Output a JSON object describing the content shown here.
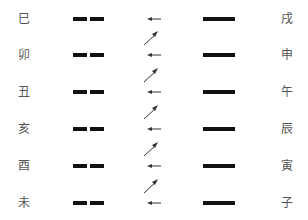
{
  "diagram": {
    "rows": [
      {
        "left_label": "巳",
        "right_label": "戌",
        "left_line": "broken",
        "right_line": "solid"
      },
      {
        "left_label": "卯",
        "right_label": "申",
        "left_line": "broken",
        "right_line": "solid"
      },
      {
        "left_label": "丑",
        "right_label": "午",
        "left_line": "broken",
        "right_line": "solid"
      },
      {
        "left_label": "亥",
        "right_label": "辰",
        "left_line": "broken",
        "right_line": "solid"
      },
      {
        "left_label": "酉",
        "right_label": "寅",
        "left_line": "broken",
        "right_line": "solid"
      },
      {
        "left_label": "未",
        "right_label": "子",
        "left_line": "broken",
        "right_line": "solid"
      }
    ],
    "colors": {
      "line": "#111111",
      "text": "#555555",
      "arrow": "#333333"
    }
  }
}
